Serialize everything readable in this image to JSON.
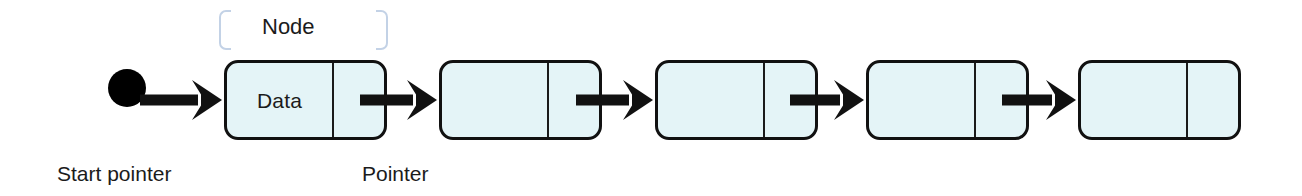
{
  "diagram": {
    "background_color": "#ffffff",
    "node_fill_color": "#e4f4f7",
    "node_border_color": "#111111",
    "arrow_color": "#111111",
    "bracket_color": "#c3d2e6",
    "text_color": "#1b1b1b"
  },
  "annotations": {
    "node_label": "Node",
    "start_pointer_label": "Start pointer",
    "pointer_label": "Pointer"
  },
  "start_pointer": {
    "shape": "filled-circle",
    "x": 108,
    "y": 88,
    "diameter": 38
  },
  "nodes": [
    {
      "index": 1,
      "x": 224,
      "y": 60,
      "width": 163,
      "height": 80,
      "data_cell_width": 107,
      "data_text": "Data",
      "pointer_text": ""
    },
    {
      "index": 2,
      "x": 439,
      "y": 60,
      "width": 163,
      "height": 80,
      "data_cell_width": 107,
      "data_text": "",
      "pointer_text": ""
    },
    {
      "index": 3,
      "x": 655,
      "y": 60,
      "width": 163,
      "height": 80,
      "data_cell_width": 107,
      "data_text": "",
      "pointer_text": ""
    },
    {
      "index": 4,
      "x": 866,
      "y": 60,
      "width": 163,
      "height": 80,
      "data_cell_width": 107,
      "data_text": "",
      "pointer_text": ""
    },
    {
      "index": 5,
      "x": 1078,
      "y": 60,
      "width": 163,
      "height": 80,
      "data_cell_width": 107,
      "data_text": "",
      "pointer_text": ""
    }
  ],
  "arrows": [
    {
      "name": "start-to-node-1",
      "from_x": 140,
      "to_x": 222,
      "y": 100
    },
    {
      "name": "node-1-to-node-2",
      "from_x": 360,
      "to_x": 437,
      "y": 100
    },
    {
      "name": "node-2-to-node-3",
      "from_x": 576,
      "to_x": 653,
      "y": 100
    },
    {
      "name": "node-3-to-node-4",
      "from_x": 790,
      "to_x": 864,
      "y": 100
    },
    {
      "name": "node-4-to-node-5",
      "from_x": 1002,
      "to_x": 1076,
      "y": 100
    }
  ],
  "bracket_annotation": {
    "left_x": 219,
    "right_x": 376,
    "y": 10,
    "caption_x": 262,
    "caption_y": 16
  },
  "captions": [
    {
      "name": "start-pointer-caption",
      "text_key": "start_pointer_label",
      "x": 57,
      "y": 163
    },
    {
      "name": "pointer-caption",
      "text_key": "pointer_label",
      "x": 362,
      "y": 163
    }
  ]
}
